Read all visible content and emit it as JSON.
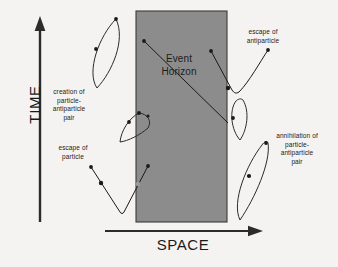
{
  "diagram": {
    "background_color": "#f5f3f1",
    "ink_color": "#2b2b2b",
    "axes": {
      "time_label": "TIME",
      "space_label": "SPACE"
    },
    "region": {
      "name": "black-hole-interior",
      "label": "Event\nHorizon",
      "fill_color": "#8c8c8c",
      "border_color": "#333333",
      "x": 136,
      "y": 11,
      "width": 91,
      "height": 211
    },
    "annotations": [
      {
        "id": "creation",
        "text": "creation of\nparticle-\nantiparticle\npair"
      },
      {
        "id": "escape-particle",
        "text": "escape of\nparticle"
      },
      {
        "id": "escape-antiparticle",
        "text": "escape of\nantiparticle"
      },
      {
        "id": "annihilation",
        "text": "annihilation of\nparticle-\nantiparticle\npair"
      }
    ],
    "loops": [
      {
        "id": "loop-outside-upper-left",
        "note": "virtual pair loop outside horizon, upper left"
      },
      {
        "id": "loop-straddling-horizon",
        "note": "small loop crossing the event horizon"
      },
      {
        "id": "loop-outside-right",
        "note": "small virtual pair loop right of horizon"
      },
      {
        "id": "loop-annihilation-lower-right",
        "note": "annihilating pair loop lower right"
      }
    ],
    "worldlines": [
      {
        "id": "worldline-infalling-upper",
        "note": "diagonal line falling inward through interior"
      },
      {
        "id": "worldline-infalling-lower",
        "note": "second diagonal line inside interior"
      },
      {
        "id": "worldline-escaping-particle",
        "note": "V-shaped path escaping to the left"
      },
      {
        "id": "worldline-escaping-antiparticle",
        "note": "V-shaped path escaping to the right"
      }
    ]
  }
}
